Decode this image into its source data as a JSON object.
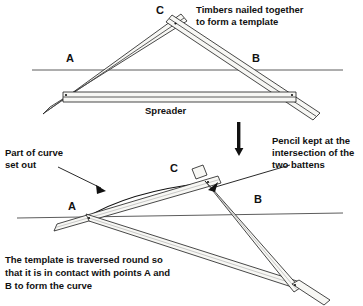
{
  "figure": {
    "background_color": "#ffffff",
    "ink_color": "#111111",
    "timber_fill": "#f7f7f4",
    "ground_line_color": "#4a4a4a"
  },
  "top_diagram": {
    "name": "template-construction",
    "points": {
      "a": "A",
      "b": "B",
      "c": "C"
    },
    "annotations": {
      "timbers_line1": "Timbers nailed together",
      "timbers_line2": "to form a template",
      "spreader": "Spreader"
    }
  },
  "transition": {
    "arrow_name": "down-arrow",
    "direction": "down"
  },
  "bottom_diagram": {
    "name": "template-traversed",
    "points": {
      "a": "A",
      "b": "B",
      "c": "C"
    },
    "annotations": {
      "part_of_curve_line1": "Part of curve",
      "part_of_curve_line2": "set out",
      "pencil_line1": "Pencil kept at the",
      "pencil_line2": "intersection of the",
      "pencil_line3": "two battens",
      "caption_line1": "The template is traversed round so",
      "caption_line2": "that it is in contact with points A and",
      "caption_line3": "B to form the curve"
    }
  }
}
